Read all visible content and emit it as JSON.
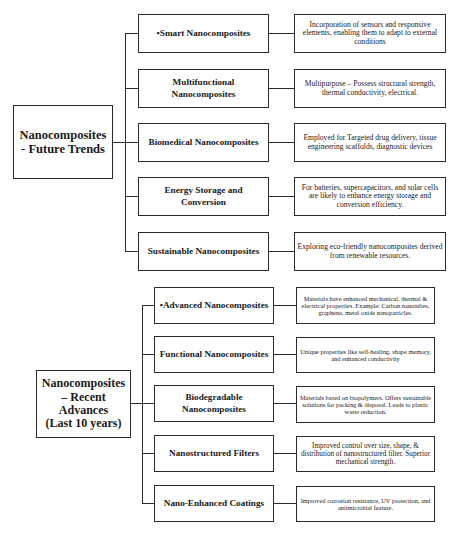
{
  "diagram": {
    "future_trends": {
      "title": "Nanocomposites - Future Trends",
      "title_lines": [
        "Nanocomposites",
        "- Future Trends"
      ],
      "branches": [
        {
          "label": "•Smart Nanocomposites",
          "description": "Incorporation of sensors and responsive elements, enabling them to adapt to external conditions"
        },
        {
          "label": "Multifunctional Nanocomposites",
          "description": "Multipurpose – Possess structural strength, thermal conductivity, electrical."
        },
        {
          "label": "Biomedical Nanocomposites",
          "description": "Employed for Targeted drug delivery, tissue engineering scaffolds, diagnostic devices"
        },
        {
          "label": "Energy Storage and Conversion",
          "description": "For batteries, supercapacitors, and solar cells are likely to enhance energy storage and conversion efficiency."
        },
        {
          "label": "Sustainable Nanocomposites",
          "description": "Exploring eco-friendly nanocomposites derived from renewable resources."
        }
      ]
    },
    "recent_advances": {
      "title": "Nanocomposites – Recent Advances (Last 10 years)",
      "title_lines": [
        "Nanocomposites",
        "– Recent",
        "Advances",
        "(Last 10 years)"
      ],
      "branches": [
        {
          "label": "•Advanced Nanocomposites",
          "description": "Materials have enhanced mechanical, thermal & electrical properties. Example: Carbon nanotubes, graphene, metal oxide nanoparticles."
        },
        {
          "label": "Functional Nanocomposites",
          "description": "Unique properties like self-healing, shape memory,  and enhanced conductivity"
        },
        {
          "label": "Biodegradable Nanocomposites",
          "description": "Materials based on biopolymers. Offers sustainable solutions for packing & disposal. Leads to plastic waste reduction."
        },
        {
          "label": "Nanostructured Filters",
          "description": "Improved control over size, shape, & distribution of nanostructured filter. Superior mechanical strength."
        },
        {
          "label": "Nano-Enhanced Coatings",
          "description": "Improved corrosion resistance, UV protection, and antimicrobial feature."
        }
      ]
    }
  }
}
